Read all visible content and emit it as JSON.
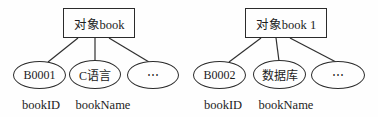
{
  "diagram": {
    "groups": [
      {
        "object_label": "对象book",
        "children": [
          {
            "value": "B0001",
            "attr": "bookID"
          },
          {
            "value": "C语言",
            "attr": "bookName"
          },
          {
            "value": "⋯"
          }
        ]
      },
      {
        "object_label": "对象book 1",
        "children": [
          {
            "value": "B0002",
            "attr": "bookID"
          },
          {
            "value": "数据库",
            "attr": "bookName"
          },
          {
            "value": "⋯"
          }
        ]
      }
    ],
    "line_color": "#2f2f2f"
  }
}
